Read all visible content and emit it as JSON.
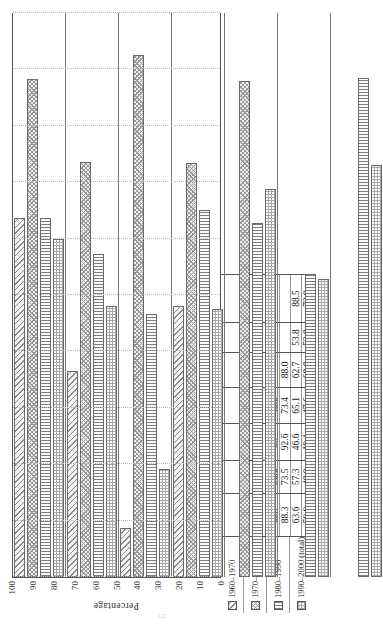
{
  "chart_data": {
    "type": "bar",
    "orientation": "horizontal-rotated",
    "title": "",
    "xlabel": "",
    "ylabel": "Percentage",
    "ylim": [
      0,
      100
    ],
    "yticks": [
      0,
      10,
      20,
      30,
      40,
      50,
      60,
      70,
      80,
      90,
      100
    ],
    "grid": true,
    "legend_position": "bottom-left-table",
    "categories": [
      "All Asians",
      "Chinese",
      "Japanese",
      "Filipinos",
      "Koreans",
      "Indians",
      "Vietnamese"
    ],
    "series": [
      {
        "name": "1960–1970",
        "values": [
          63.7,
          36.6,
          8.7,
          48.0,
          null,
          null,
          null
        ]
      },
      {
        "name": "1970–1980",
        "values": [
          88.3,
          73.5,
          92.6,
          73.4,
          88.0,
          null,
          null
        ]
      },
      {
        "name": "1980–1990",
        "values": [
          63.6,
          57.3,
          46.6,
          65.1,
          62.7,
          53.8,
          88.5
        ]
      },
      {
        "name": "1990–2000 (total)",
        "values": [
          59.9,
          48.0,
          19.1,
          47.6,
          68.8,
          52.8,
          73.0
        ]
      }
    ],
    "table": {
      "row_labels": [
        "1960–1970",
        "1970–1980",
        "1980–1990",
        "1990–2000 (total)"
      ],
      "columns": [
        {
          "name": "All Asians",
          "cells": [
            "63.7",
            "88.3",
            "63.6",
            "59.9"
          ]
        },
        {
          "name": "Chinese",
          "cells": [
            "36.6",
            "73.5",
            "57.3",
            "48.0"
          ]
        },
        {
          "name": "Japanese",
          "cells": [
            "8.7",
            "92.6",
            "46.6",
            "19.1"
          ]
        },
        {
          "name": "Filipinos",
          "cells": [
            "48.0",
            "73.4",
            "65.1",
            "47.6"
          ]
        },
        {
          "name": "Koreans",
          "cells": [
            "",
            "88.0",
            "62.7",
            "68.8"
          ]
        },
        {
          "name": "Indians",
          "cells": [
            "",
            "",
            "53.8",
            "52.8"
          ]
        },
        {
          "name": "Vietnamese",
          "cells": [
            "",
            "",
            "88.5",
            "73.0"
          ]
        }
      ]
    }
  },
  "footer": {
    "page_number": "122"
  }
}
